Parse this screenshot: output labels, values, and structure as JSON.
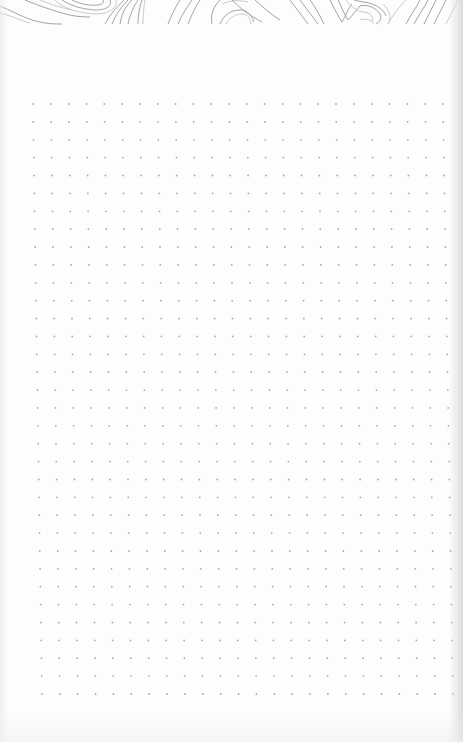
{
  "page": {
    "type": "dot-grid notebook page",
    "background": "#fdfdfd",
    "header_pattern": "topographic-contour-lines"
  },
  "dot_grid": {
    "columns": 24,
    "rows": 34,
    "top_left": [
      33,
      104
    ],
    "top_right": [
      443,
      104
    ],
    "bottom_left": [
      42,
      694
    ],
    "bottom_right": [
      453,
      694
    ],
    "dot_radius": 0.9,
    "dot_color": "#a8a8a8"
  },
  "colors": {
    "contour_line": "#9a9a9a",
    "contour_line_soft": "#c4c4c4",
    "edge_shadow": "#d7d7d7"
  }
}
